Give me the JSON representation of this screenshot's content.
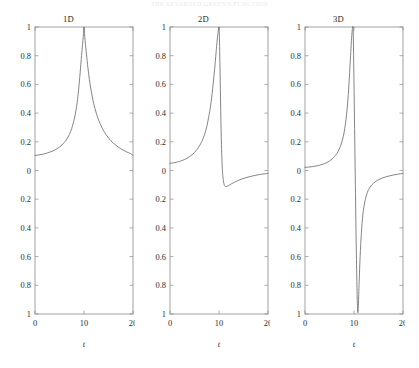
{
  "running_header": "THE RETARDED GREEN'S FUNCTION",
  "figure": {
    "x_axis_label": "t",
    "x_ticks": [
      "0",
      "10",
      "20"
    ],
    "y_ticks": [
      "1",
      "0.8",
      "0.6",
      "0.4",
      "0.2",
      "0",
      "0.2",
      "0.4",
      "0.6",
      "0.8",
      "1"
    ],
    "panels": [
      {
        "title": "1D"
      },
      {
        "title": "2D"
      },
      {
        "title": "3D"
      }
    ]
  },
  "chart_data": [
    {
      "type": "line",
      "title": "1D",
      "xlabel": "t",
      "ylabel": "",
      "xlim": [
        0,
        20
      ],
      "ylim": [
        -1,
        1
      ],
      "xticks": [
        0,
        10,
        20
      ],
      "yticks": [
        1,
        0.8,
        0.6,
        0.4,
        0.2,
        0,
        -0.2,
        -0.4,
        -0.6,
        -0.8,
        -1
      ],
      "grid": false,
      "legend": false,
      "series": [
        {
          "name": "1D",
          "x": [
            0,
            0.5,
            1,
            1.5,
            2,
            2.5,
            3,
            3.5,
            4,
            4.5,
            5,
            5.5,
            6,
            6.5,
            7,
            7.5,
            8,
            8.3,
            8.6,
            8.9,
            9.2,
            9.5,
            9.7,
            9.85,
            10,
            10.15,
            10.3,
            10.5,
            10.8,
            11.1,
            11.4,
            11.7,
            12,
            12.5,
            13,
            13.5,
            14,
            14.5,
            15,
            15.5,
            16,
            16.5,
            17,
            17.5,
            18,
            18.5,
            19,
            19.5,
            20
          ],
          "y": [
            0.105,
            0.107,
            0.11,
            0.113,
            0.117,
            0.122,
            0.128,
            0.134,
            0.142,
            0.152,
            0.164,
            0.178,
            0.196,
            0.219,
            0.25,
            0.293,
            0.357,
            0.408,
            0.474,
            0.563,
            0.677,
            0.801,
            0.878,
            0.935,
            1.0,
            0.935,
            0.878,
            0.812,
            0.716,
            0.635,
            0.568,
            0.512,
            0.464,
            0.4,
            0.35,
            0.31,
            0.277,
            0.25,
            0.227,
            0.207,
            0.19,
            0.176,
            0.163,
            0.152,
            0.142,
            0.133,
            0.125,
            0.118,
            0.105
          ]
        }
      ]
    },
    {
      "type": "line",
      "title": "2D",
      "xlabel": "t",
      "ylabel": "",
      "xlim": [
        0,
        20
      ],
      "ylim": [
        -1,
        1
      ],
      "xticks": [
        0,
        10,
        20
      ],
      "yticks": [
        1,
        0.8,
        0.6,
        0.4,
        0.2,
        0,
        -0.2,
        -0.4,
        -0.6,
        -0.8,
        -1
      ],
      "grid": false,
      "legend": false,
      "series": [
        {
          "name": "2D",
          "x": [
            0,
            0.5,
            1,
            1.5,
            2,
            2.5,
            3,
            3.5,
            4,
            4.5,
            5,
            5.5,
            6,
            6.5,
            7,
            7.5,
            8,
            8.4,
            8.8,
            9.1,
            9.4,
            9.6,
            9.8,
            9.95,
            10.05,
            10.2,
            10.35,
            10.5,
            10.7,
            10.9,
            11.1,
            11.4,
            11.8,
            12.3,
            13,
            13.8,
            14.6,
            15.5,
            16.5,
            17.5,
            18.5,
            19.3,
            20
          ],
          "y": [
            0.05,
            0.052,
            0.055,
            0.059,
            0.064,
            0.07,
            0.077,
            0.086,
            0.097,
            0.11,
            0.126,
            0.146,
            0.171,
            0.203,
            0.246,
            0.305,
            0.392,
            0.48,
            0.6,
            0.705,
            0.82,
            0.9,
            0.96,
            0.995,
            0.97,
            0.72,
            0.42,
            0.18,
            0.0,
            -0.07,
            -0.102,
            -0.112,
            -0.108,
            -0.098,
            -0.084,
            -0.071,
            -0.06,
            -0.05,
            -0.041,
            -0.033,
            -0.027,
            -0.023,
            -0.02
          ]
        }
      ]
    },
    {
      "type": "line",
      "title": "3D",
      "xlabel": "t",
      "ylabel": "",
      "xlim": [
        0,
        20
      ],
      "ylim": [
        -1,
        1
      ],
      "xticks": [
        0,
        10,
        20
      ],
      "yticks": [
        1,
        0.8,
        0.6,
        0.4,
        0.2,
        0,
        -0.2,
        -0.4,
        -0.6,
        -0.8,
        -1
      ],
      "grid": false,
      "legend": false,
      "series": [
        {
          "name": "3D",
          "x": [
            0,
            0.5,
            1,
            1.5,
            2,
            2.5,
            3,
            3.5,
            4,
            4.5,
            5,
            5.5,
            6,
            6.5,
            7,
            7.4,
            7.8,
            8.1,
            8.4,
            8.7,
            8.95,
            9.15,
            9.3,
            9.45,
            9.55,
            9.62,
            9.68,
            9.75,
            9.85,
            10.0,
            10.2,
            10.4,
            10.55,
            10.65,
            10.72,
            10.8,
            10.9,
            11.05,
            11.25,
            11.5,
            11.8,
            12.2,
            12.7,
            13.3,
            14,
            14.8,
            15.7,
            16.7,
            17.8,
            18.9,
            20
          ],
          "y": [
            0.022,
            0.023,
            0.025,
            0.027,
            0.03,
            0.033,
            0.037,
            0.042,
            0.048,
            0.056,
            0.066,
            0.079,
            0.096,
            0.118,
            0.15,
            0.185,
            0.235,
            0.29,
            0.365,
            0.47,
            0.59,
            0.71,
            0.8,
            0.89,
            0.94,
            0.97,
            0.99,
            1.0,
            0.96,
            0.6,
            0.1,
            -0.4,
            -0.72,
            -0.88,
            -0.96,
            -0.99,
            -0.93,
            -0.78,
            -0.6,
            -0.44,
            -0.31,
            -0.22,
            -0.155,
            -0.115,
            -0.088,
            -0.068,
            -0.053,
            -0.042,
            -0.033,
            -0.026,
            -0.02
          ]
        }
      ]
    }
  ]
}
